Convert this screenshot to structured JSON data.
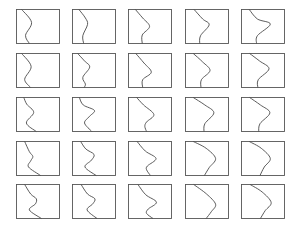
{
  "figure": {
    "rows": 5,
    "cols": 5,
    "frame_color": "#555555",
    "curve_color": "#4a4a4a",
    "panels": [
      {
        "row": 1,
        "col": 1,
        "curve": [
          [
            0.12,
            0
          ],
          [
            0.35,
            0.38
          ],
          [
            0.21,
            0.76
          ],
          [
            0.3,
            1
          ]
        ]
      },
      {
        "row": 1,
        "col": 2,
        "curve": [
          [
            0.15,
            0
          ],
          [
            0.3,
            0.25
          ],
          [
            0.35,
            0.44
          ],
          [
            0.24,
            0.77
          ],
          [
            0.26,
            1
          ]
        ]
      },
      {
        "row": 1,
        "col": 3,
        "curve": [
          [
            0.16,
            0
          ],
          [
            0.33,
            0.25
          ],
          [
            0.49,
            0.5
          ],
          [
            0.32,
            0.75
          ],
          [
            0.32,
            1
          ]
        ]
      },
      {
        "row": 1,
        "col": 4,
        "curve": [
          [
            0.2,
            0
          ],
          [
            0.4,
            0.28
          ],
          [
            0.55,
            0.45
          ],
          [
            0.35,
            0.77
          ],
          [
            0.33,
            1
          ]
        ]
      },
      {
        "row": 1,
        "col": 5,
        "curve": [
          [
            0.18,
            0
          ],
          [
            0.37,
            0.28
          ],
          [
            0.67,
            0.43
          ],
          [
            0.37,
            0.77
          ],
          [
            0.35,
            1
          ]
        ]
      },
      {
        "row": 2,
        "col": 1,
        "curve": [
          [
            0.12,
            0
          ],
          [
            0.34,
            0.38
          ],
          [
            0.19,
            0.76
          ],
          [
            0.33,
            1
          ]
        ]
      },
      {
        "row": 2,
        "col": 2,
        "curve": [
          [
            0.12,
            0
          ],
          [
            0.28,
            0.22
          ],
          [
            0.4,
            0.4
          ],
          [
            0.24,
            0.7
          ],
          [
            0.3,
            0.9
          ],
          [
            0.27,
            1
          ]
        ]
      },
      {
        "row": 2,
        "col": 3,
        "curve": [
          [
            0.17,
            0
          ],
          [
            0.36,
            0.28
          ],
          [
            0.53,
            0.55
          ],
          [
            0.33,
            0.77
          ],
          [
            0.33,
            1
          ]
        ]
      },
      {
        "row": 2,
        "col": 4,
        "curve": [
          [
            0.18,
            0
          ],
          [
            0.4,
            0.25
          ],
          [
            0.57,
            0.5
          ],
          [
            0.37,
            0.77
          ],
          [
            0.36,
            1
          ]
        ]
      },
      {
        "row": 2,
        "col": 5,
        "curve": [
          [
            0.19,
            0
          ],
          [
            0.42,
            0.22
          ],
          [
            0.64,
            0.45
          ],
          [
            0.39,
            0.77
          ],
          [
            0.38,
            1
          ]
        ]
      },
      {
        "row": 3,
        "col": 1,
        "curve": [
          [
            0.17,
            0
          ],
          [
            0.24,
            0.2
          ],
          [
            0.4,
            0.44
          ],
          [
            0.23,
            0.75
          ],
          [
            0.46,
            1
          ]
        ]
      },
      {
        "row": 3,
        "col": 2,
        "curve": [
          [
            0.16,
            0
          ],
          [
            0.25,
            0.22
          ],
          [
            0.51,
            0.38
          ],
          [
            0.4,
            0.55
          ],
          [
            0.28,
            0.75
          ],
          [
            0.45,
            1
          ]
        ]
      },
      {
        "row": 3,
        "col": 3,
        "curve": [
          [
            0.19,
            0
          ],
          [
            0.35,
            0.22
          ],
          [
            0.59,
            0.5
          ],
          [
            0.42,
            0.72
          ],
          [
            0.38,
            0.85
          ],
          [
            0.42,
            1
          ]
        ]
      },
      {
        "row": 3,
        "col": 4,
        "curve": [
          [
            0.18,
            0
          ],
          [
            0.45,
            0.22
          ],
          [
            0.66,
            0.45
          ],
          [
            0.45,
            0.77
          ],
          [
            0.43,
            1
          ]
        ]
      },
      {
        "row": 3,
        "col": 5,
        "curve": [
          [
            0.19,
            0
          ],
          [
            0.44,
            0.22
          ],
          [
            0.66,
            0.45
          ],
          [
            0.43,
            0.77
          ],
          [
            0.4,
            1
          ]
        ]
      },
      {
        "row": 4,
        "col": 1,
        "curve": [
          [
            0.19,
            0
          ],
          [
            0.3,
            0.3
          ],
          [
            0.38,
            0.44
          ],
          [
            0.33,
            0.57
          ],
          [
            0.28,
            0.75
          ],
          [
            0.56,
            1
          ]
        ]
      },
      {
        "row": 4,
        "col": 2,
        "curve": [
          [
            0.19,
            0
          ],
          [
            0.31,
            0.22
          ],
          [
            0.5,
            0.38
          ],
          [
            0.44,
            0.55
          ],
          [
            0.29,
            0.75
          ],
          [
            0.55,
            1
          ]
        ]
      },
      {
        "row": 4,
        "col": 3,
        "curve": [
          [
            0.2,
            0
          ],
          [
            0.39,
            0.28
          ],
          [
            0.64,
            0.5
          ],
          [
            0.44,
            0.72
          ],
          [
            0.42,
            0.83
          ],
          [
            0.51,
            1
          ]
        ]
      },
      {
        "row": 4,
        "col": 4,
        "curve": [
          [
            0.18,
            0
          ],
          [
            0.48,
            0.2
          ],
          [
            0.7,
            0.5
          ],
          [
            0.55,
            0.77
          ],
          [
            0.44,
            1
          ]
        ]
      },
      {
        "row": 4,
        "col": 5,
        "curve": [
          [
            0.18,
            0
          ],
          [
            0.46,
            0.2
          ],
          [
            0.67,
            0.5
          ],
          [
            0.53,
            0.75
          ],
          [
            0.43,
            1
          ]
        ]
      },
      {
        "row": 5,
        "col": 1,
        "curve": [
          [
            0.19,
            0
          ],
          [
            0.33,
            0.28
          ],
          [
            0.46,
            0.42
          ],
          [
            0.44,
            0.57
          ],
          [
            0.3,
            0.75
          ],
          [
            0.58,
            1
          ]
        ]
      },
      {
        "row": 5,
        "col": 2,
        "curve": [
          [
            0.2,
            0
          ],
          [
            0.35,
            0.28
          ],
          [
            0.52,
            0.42
          ],
          [
            0.47,
            0.57
          ],
          [
            0.34,
            0.75
          ],
          [
            0.57,
            1
          ]
        ]
      },
      {
        "row": 5,
        "col": 3,
        "curve": [
          [
            0.22,
            0
          ],
          [
            0.4,
            0.3
          ],
          [
            0.65,
            0.52
          ],
          [
            0.46,
            0.72
          ],
          [
            0.42,
            0.85
          ],
          [
            0.57,
            1
          ]
        ]
      },
      {
        "row": 5,
        "col": 4,
        "curve": [
          [
            0.19,
            0
          ],
          [
            0.49,
            0.28
          ],
          [
            0.7,
            0.58
          ],
          [
            0.6,
            0.8
          ],
          [
            0.48,
            1
          ]
        ]
      },
      {
        "row": 5,
        "col": 5,
        "curve": [
          [
            0.2,
            0
          ],
          [
            0.48,
            0.22
          ],
          [
            0.69,
            0.53
          ],
          [
            0.55,
            0.77
          ],
          [
            0.44,
            1
          ]
        ]
      }
    ]
  }
}
